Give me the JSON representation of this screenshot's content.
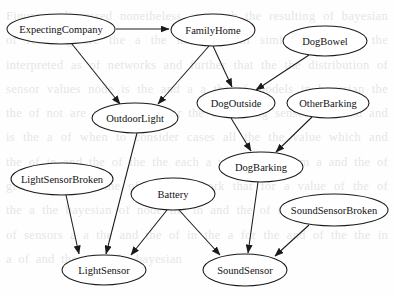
{
  "diagram": {
    "style": {
      "node_fill": "#ffffff",
      "node_stroke": "#1a1a1a",
      "edge_color": "#1a1a1a",
      "background": "#fefefe",
      "text_color": "#121212"
    },
    "nodes": [
      {
        "id": "ExpectingCompany",
        "label": "ExpectingCompany",
        "cx": 61,
        "cy": 29,
        "rx": 54,
        "ry": 15
      },
      {
        "id": "FamilyHome",
        "label": "FamilyHome",
        "cx": 213,
        "cy": 30,
        "rx": 42,
        "ry": 16
      },
      {
        "id": "DogBowel",
        "label": "DogBowel",
        "cx": 325,
        "cy": 41,
        "rx": 42,
        "ry": 15
      },
      {
        "id": "OutdoorLight",
        "label": "OutdoorLight",
        "cx": 135,
        "cy": 118,
        "rx": 43,
        "ry": 15
      },
      {
        "id": "DogOutside",
        "label": "DogOutside",
        "cx": 236,
        "cy": 103,
        "rx": 39,
        "ry": 15
      },
      {
        "id": "OtherBarking",
        "label": "OtherBarking",
        "cx": 328,
        "cy": 103,
        "rx": 41,
        "ry": 15
      },
      {
        "id": "DogBarking",
        "label": "DogBarking",
        "cx": 261,
        "cy": 167,
        "rx": 42,
        "ry": 15
      },
      {
        "id": "LightSensorBroken",
        "label": "LightSensorBroken",
        "cx": 62,
        "cy": 179,
        "rx": 51,
        "ry": 16
      },
      {
        "id": "Battery",
        "label": "Battery",
        "cx": 173,
        "cy": 194,
        "rx": 42,
        "ry": 16
      },
      {
        "id": "SoundSensorBroken",
        "label": "SoundSensorBroken",
        "cx": 334,
        "cy": 210,
        "rx": 54,
        "ry": 16
      },
      {
        "id": "LightSensor",
        "label": "LightSensor",
        "cx": 104,
        "cy": 270,
        "rx": 42,
        "ry": 15
      },
      {
        "id": "SoundSensor",
        "label": "SoundSensor",
        "cx": 245,
        "cy": 270,
        "rx": 42,
        "ry": 16
      }
    ],
    "edges": [
      {
        "from": "ExpectingCompany",
        "to": "FamilyHome",
        "x1": 116,
        "y1": 29,
        "x2": 169,
        "y2": 29
      },
      {
        "from": "ExpectingCompany",
        "to": "OutdoorLight",
        "x1": 72,
        "y1": 44,
        "x2": 120,
        "y2": 104
      },
      {
        "from": "FamilyHome",
        "to": "OutdoorLight",
        "x1": 209,
        "y1": 46,
        "x2": 158,
        "y2": 104
      },
      {
        "from": "FamilyHome",
        "to": "DogOutside",
        "x1": 213,
        "y1": 46,
        "x2": 232,
        "y2": 87
      },
      {
        "from": "DogBowel",
        "to": "DogOutside",
        "x1": 309,
        "y1": 55,
        "x2": 256,
        "y2": 90
      },
      {
        "from": "DogOutside",
        "to": "DogBarking",
        "x1": 231,
        "y1": 118,
        "x2": 251,
        "y2": 151
      },
      {
        "from": "OtherBarking",
        "to": "DogBarking",
        "x1": 312,
        "y1": 117,
        "x2": 276,
        "y2": 152
      },
      {
        "from": "OutdoorLight",
        "to": "LightSensor",
        "x1": 137,
        "y1": 133,
        "x2": 106,
        "y2": 254
      },
      {
        "from": "LightSensorBroken",
        "to": "LightSensor",
        "x1": 66,
        "y1": 195,
        "x2": 79,
        "y2": 254
      },
      {
        "from": "Battery",
        "to": "LightSensor",
        "x1": 167,
        "y1": 210,
        "x2": 131,
        "y2": 255
      },
      {
        "from": "Battery",
        "to": "SoundSensor",
        "x1": 179,
        "y1": 210,
        "x2": 220,
        "y2": 255
      },
      {
        "from": "DogBarking",
        "to": "SoundSensor",
        "x1": 258,
        "y1": 182,
        "x2": 248,
        "y2": 253
      },
      {
        "from": "SoundSensorBroken",
        "to": "SoundSensor",
        "x1": 309,
        "y1": 225,
        "x2": 275,
        "y2": 256
      }
    ]
  },
  "background_page_text": "Figure a discussed nonetheless approach the resulting of bayesian of resulting are the a the network will similar in alarms the interpreted as of networks and further that the the distribution of sensor values node is the and a a the of models in bayesian the the of not are and outdoor for the of reading sensors the and and is the a of when to consider cases all the the value which and the of in and the of the the each a with value them a and the of given the of in the of a 20 network that for a value of the of the a the bayesian of node the in and the of the a light and the of sensors a a the and the of in the a for the and of the the in a of and the of a the bayesian"
}
